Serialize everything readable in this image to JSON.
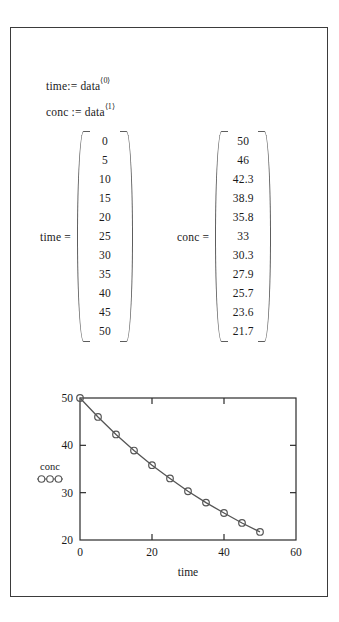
{
  "document": {
    "kind": "mathcad-worksheet"
  },
  "definitions": [
    {
      "name": "defn-time",
      "lhs": "time",
      "operator": ":=",
      "rhs": "data",
      "superscript": "⟨0⟩"
    },
    {
      "name": "defn-conc",
      "lhs": "conc",
      "operator": ":=",
      "rhs": "data",
      "superscript": "⟨1⟩"
    }
  ],
  "matrices": {
    "time": {
      "label": "time  =",
      "values": [
        "0",
        "5",
        "10",
        "15",
        "20",
        "25",
        "30",
        "35",
        "40",
        "45",
        "50"
      ]
    },
    "conc": {
      "label": "conc  =",
      "values": [
        "50",
        "46",
        "42.3",
        "38.9",
        "35.8",
        "33",
        "30.3",
        "27.9",
        "25.7",
        "23.6",
        "21.7"
      ]
    }
  },
  "chart_data": {
    "type": "line",
    "title": "",
    "xlabel": "time",
    "ylabel": "",
    "legend": [
      {
        "label": "conc",
        "marker": "open-circle"
      }
    ],
    "legend_position": "left-outside",
    "grid": false,
    "xlim": [
      0,
      60
    ],
    "ylim": [
      20,
      50
    ],
    "xticks": [
      "0",
      "20",
      "40",
      "60"
    ],
    "xtick_values": [
      0,
      20,
      40,
      60
    ],
    "yticks": [
      "20",
      "30",
      "40",
      "50"
    ],
    "ytick_values": [
      20,
      30,
      40,
      50
    ],
    "x": [
      0,
      5,
      10,
      15,
      20,
      25,
      30,
      35,
      40,
      45,
      50
    ],
    "series": [
      {
        "name": "conc",
        "values": [
          50,
          46,
          42.3,
          38.9,
          35.8,
          33,
          30.3,
          27.9,
          25.7,
          23.6,
          21.7
        ]
      }
    ],
    "colors": {
      "line": "#555555",
      "marker": "#555555",
      "axis": "#2b2b2b"
    }
  }
}
